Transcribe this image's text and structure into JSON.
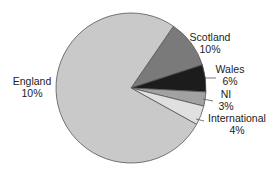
{
  "chart_data": {
    "type": "pie",
    "title": "",
    "center": [
      131,
      88
    ],
    "radius": 75,
    "start_angle_deg": 55.5,
    "slices": [
      {
        "name": "Scotland",
        "label": "Scotland",
        "pct_label": "10%",
        "value": 10,
        "sweep_deg": 37.5,
        "color": "#7a7a7a",
        "text": {
          "x": 210,
          "y": 41,
          "anchor": "middle"
        },
        "leader": null
      },
      {
        "name": "Wales",
        "label": "Wales",
        "pct_label": "6%",
        "value": 6,
        "sweep_deg": 21,
        "color": "#1c1c1c",
        "text": {
          "x": 230,
          "y": 73,
          "anchor": "middle"
        },
        "leader": [
          205,
          78,
          216,
          78
        ]
      },
      {
        "name": "NI",
        "label": "NI",
        "pct_label": "3%",
        "value": 3,
        "sweep_deg": 11,
        "color": "#a2a2a2",
        "text": {
          "x": 226,
          "y": 98,
          "anchor": "middle"
        },
        "leader": [
          203,
          99,
          213,
          101
        ]
      },
      {
        "name": "International",
        "label": "International",
        "pct_label": "4%",
        "value": 4,
        "sweep_deg": 15,
        "color": "#e0e0e0",
        "text": {
          "x": 237,
          "y": 122,
          "anchor": "middle"
        },
        "leader": [
          196,
          119,
          204,
          121
        ]
      },
      {
        "name": "England",
        "label": "England",
        "pct_label": "10%",
        "value": 77,
        "sweep_deg": 275.5,
        "color": "#c9c9c9",
        "text": {
          "x": 32,
          "y": 85,
          "anchor": "middle"
        },
        "leader": null
      }
    ]
  }
}
